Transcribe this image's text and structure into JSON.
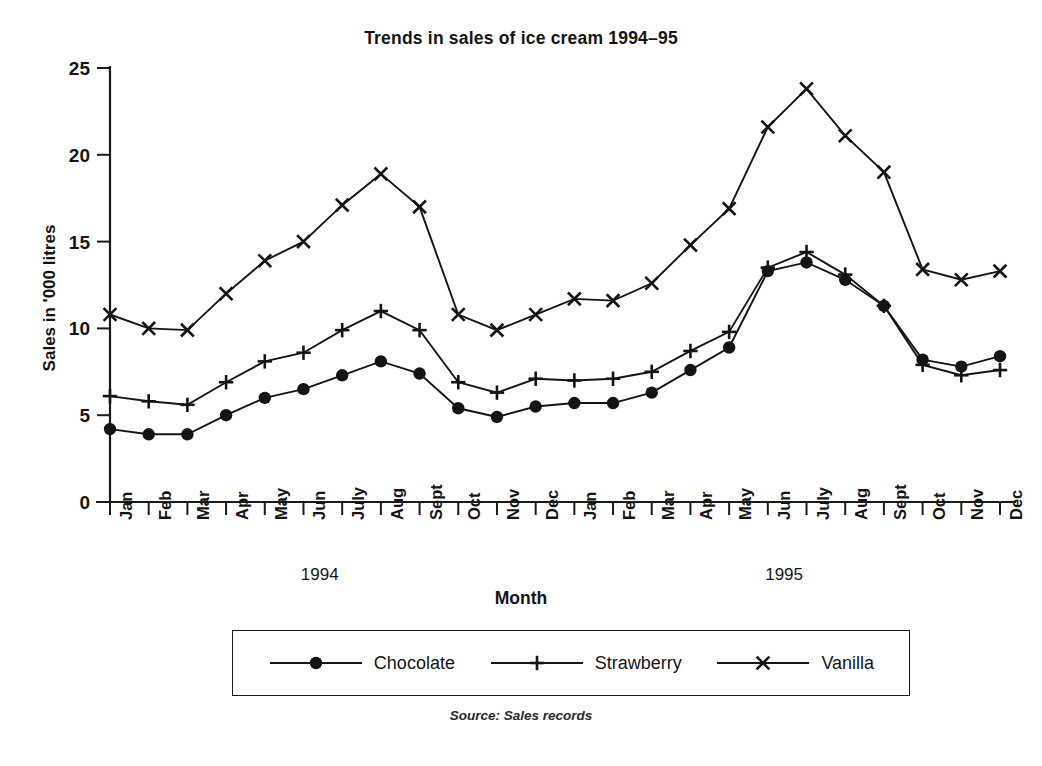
{
  "chart_data": {
    "type": "line",
    "title": "Trends in sales of ice cream 1994–95",
    "xlabel": "Month",
    "ylabel": "Sales in '000 litres",
    "source": "Source: Sales records",
    "grid": false,
    "legend_position": "bottom",
    "ylim": [
      0,
      25
    ],
    "yticks": [
      0,
      5,
      10,
      15,
      20,
      25
    ],
    "categories": [
      "Jan",
      "Feb",
      "Mar",
      "Apr",
      "May",
      "Jun",
      "July",
      "Aug",
      "Sept",
      "Oct",
      "Nov",
      "Dec",
      "Jan",
      "Feb",
      "Mar",
      "Apr",
      "May",
      "Jun",
      "July",
      "Aug",
      "Sept",
      "Oct",
      "Nov",
      "Dec"
    ],
    "group_labels": [
      {
        "label": "1994",
        "start_index": 0,
        "end_index": 11
      },
      {
        "label": "1995",
        "start_index": 12,
        "end_index": 23
      }
    ],
    "series": [
      {
        "name": "Chocolate",
        "marker": "filled-circle",
        "values": [
          4.2,
          3.9,
          3.9,
          5.0,
          6.0,
          6.5,
          7.3,
          8.1,
          7.4,
          5.4,
          4.9,
          5.5,
          5.7,
          5.7,
          6.3,
          7.6,
          8.9,
          13.3,
          13.8,
          12.8,
          11.3,
          8.2,
          7.8,
          8.4
        ]
      },
      {
        "name": "Strawberry",
        "marker": "plus",
        "values": [
          6.1,
          5.8,
          5.6,
          6.9,
          8.1,
          8.6,
          9.9,
          11.0,
          9.9,
          6.9,
          6.3,
          7.1,
          7.0,
          7.1,
          7.5,
          8.7,
          9.8,
          13.5,
          14.4,
          13.1,
          11.3,
          7.9,
          7.3,
          7.6
        ]
      },
      {
        "name": "Vanilla",
        "marker": "cross",
        "values": [
          10.8,
          10.0,
          9.9,
          12.0,
          13.9,
          15.0,
          17.1,
          18.9,
          17.0,
          10.8,
          9.9,
          10.8,
          11.7,
          11.6,
          12.6,
          14.8,
          16.9,
          21.6,
          23.8,
          21.1,
          19.0,
          13.4,
          12.8,
          13.3
        ]
      }
    ]
  }
}
